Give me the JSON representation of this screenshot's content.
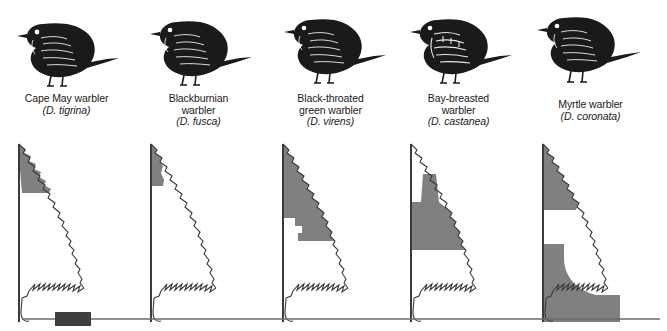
{
  "figure": {
    "shade_color": "#808080",
    "line_color": "#3a3a3a",
    "bird_color": "#1a1a1a"
  },
  "species": [
    {
      "common_line1": "Cape May warbler",
      "common_line2": "",
      "common_line3": "",
      "scientific": "(D. tigrina)",
      "bird_icon": "warbler-bird-icon",
      "tree_icon": "spruce-tree-icon",
      "zone_name": "upper-outer-crown",
      "zone_description": "Narrow band along upper outer edge of crown, top third of tree"
    },
    {
      "common_line1": "Blackburnian",
      "common_line2": "warbler",
      "common_line3": "",
      "scientific": "(D. fusca)",
      "bird_icon": "warbler-bird-icon",
      "tree_icon": "spruce-tree-icon",
      "zone_name": "top-crown-near-trunk",
      "zone_description": "Narrow wedge hugging trunk at very top of tree"
    },
    {
      "common_line1": "Black-throated",
      "common_line2": "green warbler",
      "common_line3": "",
      "scientific": "(D. virens)",
      "bird_icon": "warbler-bird-icon",
      "tree_icon": "spruce-tree-icon",
      "zone_name": "upper-middle-broad",
      "zone_description": "Broad wedge covering upper and upper-middle portion of tree"
    },
    {
      "common_line1": "Bay-breasted",
      "common_line2": "warbler",
      "common_line3": "",
      "scientific": "(D. castanea)",
      "bird_icon": "warbler-bird-icon",
      "tree_icon": "spruce-tree-icon",
      "zone_name": "middle-interior",
      "zone_description": "Middle interior block with narrow column rising toward crown"
    },
    {
      "common_line1": "Myrtle warbler",
      "common_line2": "",
      "common_line3": "",
      "scientific": "(D. coronata)",
      "bird_icon": "warbler-bird-icon",
      "tree_icon": "spruce-tree-icon",
      "zone_name": "crown-and-lower-trunk",
      "zone_description": "Small crown patch plus large lower region around base and ground"
    }
  ],
  "baseline": {
    "ground_line_name": "ground-line",
    "marker_name": "scale-marker"
  }
}
